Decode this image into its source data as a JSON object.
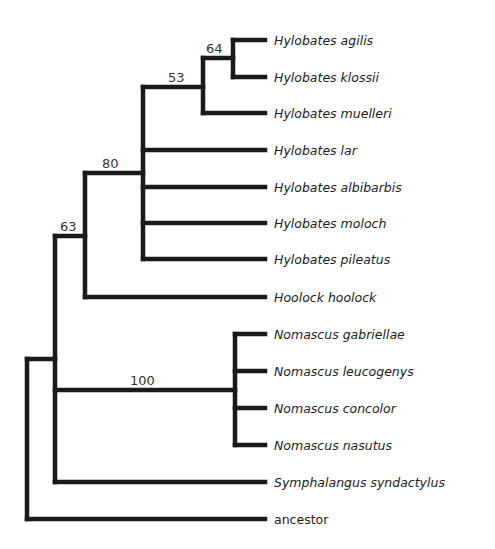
{
  "diagram": {
    "type": "phylogenetic-tree",
    "line_color": "#1a1a1a",
    "text_color": "#222222",
    "tips": [
      {
        "id": "t1",
        "label": "Hylobates agilis",
        "italic": true,
        "y": 40
      },
      {
        "id": "t2",
        "label": "Hylobates klossii",
        "italic": true,
        "y": 77
      },
      {
        "id": "t3",
        "label": "Hylobates muelleri",
        "italic": true,
        "y": 113
      },
      {
        "id": "t4",
        "label": "Hylobates lar",
        "italic": true,
        "y": 150
      },
      {
        "id": "t5",
        "label": "Hylobates albibarbis",
        "italic": true,
        "y": 187
      },
      {
        "id": "t6",
        "label": "Hylobates moloch",
        "italic": true,
        "y": 223
      },
      {
        "id": "t7",
        "label": "Hylobates pileatus",
        "italic": true,
        "y": 259
      },
      {
        "id": "t8",
        "label": "Hoolock hoolock",
        "italic": true,
        "y": 297
      },
      {
        "id": "t9",
        "label": "Nomascus gabriellae",
        "italic": true,
        "y": 334
      },
      {
        "id": "t10",
        "label": "Nomascus leucogenys",
        "italic": true,
        "y": 371
      },
      {
        "id": "t11",
        "label": "Nomascus concolor",
        "italic": true,
        "y": 408
      },
      {
        "id": "t12",
        "label": "Nomascus nasutus",
        "italic": true,
        "y": 445
      },
      {
        "id": "t13",
        "label": "Symphalangus syndactylus",
        "italic": true,
        "y": 482
      },
      {
        "id": "t14",
        "label": "ancestor",
        "italic": false,
        "y": 519
      }
    ],
    "tip_x": 265,
    "nodes": [
      {
        "id": "n64",
        "x": 233,
        "y_top": 40,
        "y_bottom": 77,
        "parent_x": 203,
        "y": 58,
        "support": "64"
      },
      {
        "id": "n53",
        "x": 203,
        "y_top": 58,
        "y_bottom": 113,
        "parent_x": 143,
        "y": 87,
        "support": "53"
      },
      {
        "id": "n80",
        "x": 143,
        "y_top": 87,
        "y_bottom": 259,
        "parent_x": 85,
        "y": 173,
        "support": "80"
      },
      {
        "id": "nHH",
        "x": 85,
        "y_top": 173,
        "y_bottom": 297,
        "parent_x": 55,
        "y": 236,
        "support": ""
      },
      {
        "id": "n100",
        "x": 235,
        "y_top": 334,
        "y_bottom": 445,
        "parent_x": 55,
        "y": 390,
        "support": "100"
      },
      {
        "id": "n63",
        "x": 55,
        "y_top": 236,
        "y_bottom": 482,
        "parent_x": 27,
        "y": 359,
        "support": "63"
      },
      {
        "id": "root",
        "x": 27,
        "y_top": 359,
        "y_bottom": 519,
        "parent_x": null,
        "y": null,
        "support": ""
      }
    ],
    "tip_parents": {
      "t1": 233,
      "t2": 233,
      "t3": 203,
      "t4": 143,
      "t5": 143,
      "t6": 143,
      "t7": 143,
      "t8": 85,
      "t9": 235,
      "t10": 235,
      "t11": 235,
      "t12": 235,
      "t13": 55,
      "t14": 27
    },
    "support_labels": [
      {
        "node": "n64",
        "text": "64",
        "x": 206,
        "y": 53
      },
      {
        "node": "n53",
        "text": "53",
        "x": 168,
        "y": 82
      },
      {
        "node": "n80",
        "text": "80",
        "x": 102,
        "y": 168
      },
      {
        "node": "n63",
        "text": "63",
        "x": 60,
        "y": 231
      },
      {
        "node": "n100",
        "text": "100",
        "x": 130,
        "y": 385
      }
    ]
  }
}
